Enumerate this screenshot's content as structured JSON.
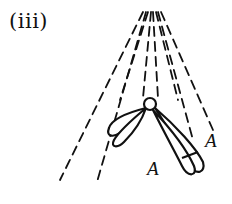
{
  "figure": {
    "panel_label": "(iii)",
    "labels": [
      {
        "text": "A",
        "x": 147,
        "y": 158
      },
      {
        "text": "A",
        "x": 205,
        "y": 130
      }
    ],
    "colors": {
      "stroke": "#111111",
      "background": "#ffffff"
    },
    "spindle_fibers": {
      "count": 9,
      "style": "dashed",
      "converge_point": [
        150,
        8
      ]
    },
    "centromere": {
      "cx": 150,
      "cy": 104,
      "r": 6
    },
    "chromosome_arms": [
      {
        "side": "left",
        "description": "two sister chromatids extending down-left"
      },
      {
        "side": "right",
        "description": "two sister chromatids extending down-right with band"
      }
    ]
  }
}
